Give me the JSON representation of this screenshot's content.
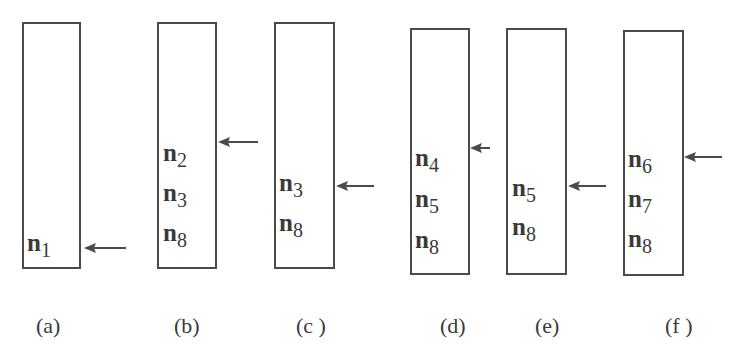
{
  "diagram": {
    "panels": [
      {
        "id": "a",
        "caption": "(a)",
        "items": [
          {
            "base": "n",
            "sub": "1"
          }
        ],
        "pointer_row": 0
      },
      {
        "id": "b",
        "caption": "(b)",
        "items": [
          {
            "base": "n",
            "sub": "2"
          },
          {
            "base": "n",
            "sub": "3"
          },
          {
            "base": "n",
            "sub": "8"
          }
        ],
        "pointer_row": 0
      },
      {
        "id": "c",
        "caption": "(c )",
        "items": [
          {
            "base": "n",
            "sub": "3"
          },
          {
            "base": "n",
            "sub": "8"
          }
        ],
        "pointer_row": 0
      },
      {
        "id": "d",
        "caption": "(d)",
        "items": [
          {
            "base": "n",
            "sub": "4"
          },
          {
            "base": "n",
            "sub": "5"
          },
          {
            "base": "n",
            "sub": "8"
          }
        ],
        "pointer_row": 0
      },
      {
        "id": "e",
        "caption": "(e)",
        "items": [
          {
            "base": "n",
            "sub": "5"
          },
          {
            "base": "n",
            "sub": "8"
          }
        ],
        "pointer_row": 0
      },
      {
        "id": "f",
        "caption": "(f )",
        "items": [
          {
            "base": "n",
            "sub": "6"
          },
          {
            "base": "n",
            "sub": "7"
          },
          {
            "base": "n",
            "sub": "8"
          }
        ],
        "pointer_row": 0
      }
    ],
    "colors": {
      "stroke": "#4a4a4a",
      "text": "#3a3a3a",
      "background": "#ffffff"
    }
  }
}
